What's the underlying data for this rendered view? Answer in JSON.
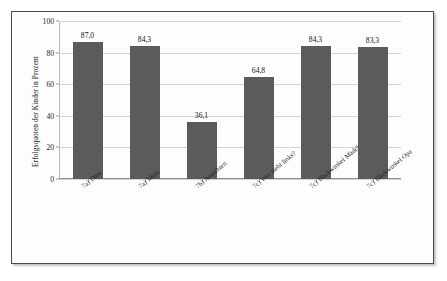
{
  "chart_data": {
    "type": "bar",
    "title": "",
    "xlabel": "",
    "ylabel": "Erfolgsquoten der Kinder in Prozent",
    "ylim": [
      0,
      100
    ],
    "ytick_labels": [
      "0",
      "20",
      "40",
      "60",
      "80",
      "100"
    ],
    "ytick_values": [
      0,
      20,
      40,
      60,
      80,
      100
    ],
    "grid": true,
    "legend": false,
    "bar_color": "#5b5b5b",
    "categories": [
      "7a) Dani",
      "7a) Maxi",
      "7b) Ansichten",
      "7c) Wer steht links?",
      "7c) Blickwinkel Mädchen",
      "7c) Blickwinkel Opa"
    ],
    "values": [
      87.0,
      84.3,
      36.1,
      64.8,
      84.3,
      83.3
    ],
    "value_labels": [
      "87,0",
      "84,3",
      "36,1",
      "64,8",
      "84,3",
      "83,3"
    ]
  }
}
